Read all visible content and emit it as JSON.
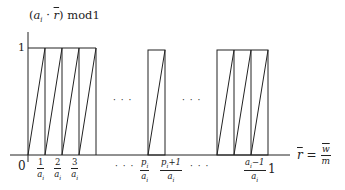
{
  "diagram": {
    "title_label": "(a_i · r̄) mod1",
    "title_parts": {
      "open": "(",
      "a": "a",
      "sub": "i",
      "dot": " · ",
      "r": "r",
      "close": ")",
      "mod": " mod1"
    },
    "y_tick_label": "1",
    "origin_label": "0",
    "x_axis_label": {
      "lhs": "r",
      "eq": "=",
      "num": "w",
      "den": "m"
    },
    "x_tick_labels": [
      {
        "num": "1",
        "den": "a_i"
      },
      {
        "num": "2",
        "den": "a_i"
      },
      {
        "num": "3",
        "den": "a_i"
      },
      {
        "num": "p_i",
        "den": "a_i"
      },
      {
        "num": "p_i+1",
        "den": "a_i"
      },
      {
        "num": "a_i−1",
        "den": "a_i"
      }
    ],
    "x_end_label": "1",
    "ellipsis": "· · ·",
    "colors": {
      "line": "#222222",
      "background": "#ffffff"
    }
  },
  "chart_data": {
    "type": "line",
    "xlabel": "r̄ = w/m",
    "ylabel": "(a_i · r̄) mod1",
    "x_ticks": [
      "0",
      "1/a_i",
      "2/a_i",
      "3/a_i",
      "…",
      "p_i/a_i",
      "(p_i+1)/a_i",
      "…",
      "(a_i−1)/a_i",
      "1"
    ],
    "y_ticks": [
      "1"
    ],
    "ylim": [
      0,
      1
    ],
    "segments_shown": [
      {
        "from": "0",
        "to": "1/a_i"
      },
      {
        "from": "1/a_i",
        "to": "2/a_i"
      },
      {
        "from": "2/a_i",
        "to": "3/a_i"
      },
      {
        "from": "3/a_i",
        "to": "4/a_i"
      },
      {
        "from": "p_i/a_i",
        "to": "(p_i+1)/a_i"
      },
      {
        "from": "(a_i−3)/a_i",
        "to": "(a_i−2)/a_i"
      },
      {
        "from": "(a_i−2)/a_i",
        "to": "(a_i−1)/a_i"
      },
      {
        "from": "(a_i−1)/a_i",
        "to": "1"
      }
    ],
    "grid": false,
    "legend": null
  }
}
